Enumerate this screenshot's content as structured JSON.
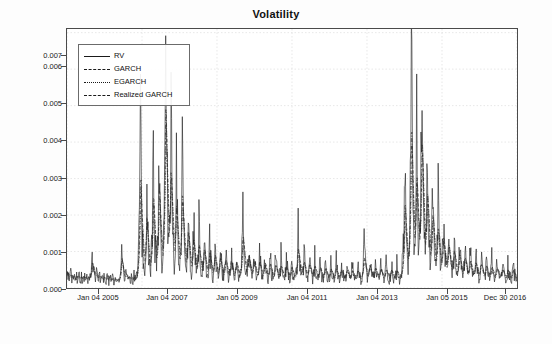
{
  "chart_data": {
    "type": "line",
    "title": "Volatility",
    "xlabel": "",
    "ylabel": "",
    "grid": true,
    "legend_position": "top-left",
    "ylim": [
      0,
      0.0071
    ],
    "ytick_labels": [
      "0.000",
      "0.001",
      "0.002",
      "0.003",
      "0.004",
      "0.005",
      "0.006",
      "0.007"
    ],
    "ytick_values": [
      0.0,
      0.001,
      0.002,
      0.003,
      0.004,
      0.005,
      0.006,
      0.007
    ],
    "xtick_labels": [
      "Jan 04 2005",
      "Jan 04 2007",
      "Jan 05 2009",
      "Jan 04 2011",
      "Jan 04 2013",
      "Jan 05 2015",
      "Dec 30 2016"
    ],
    "xtick_positions": [
      0.0,
      0.1667,
      0.3333,
      0.5,
      0.6667,
      0.8333,
      1.0
    ],
    "series": [
      {
        "name": "RV",
        "line_style": "solid",
        "color": "#1a1a1a",
        "values": [
          0.0004,
          0.00032,
          0.00028,
          0.00035,
          0.0003,
          0.00025,
          0.00027,
          0.00033,
          0.00029,
          0.00024,
          0.00031,
          0.00027,
          0.00022,
          0.00026,
          0.0003,
          0.00024,
          0.00021,
          0.00028,
          0.00034,
          0.00026,
          0.00022,
          0.00025,
          0.00031,
          0.00027,
          0.00023,
          0.0002,
          0.00026,
          0.0003,
          0.00024,
          0.00021,
          0.00027,
          0.00033,
          0.00028,
          0.00023,
          0.0002,
          0.00025,
          0.00029,
          0.00023,
          0.0002,
          0.00024,
          0.0003,
          0.00025,
          0.00021,
          0.00027,
          0.00035,
          0.00046,
          0.00062,
          0.00088,
          0.0007,
          0.00052,
          0.0004,
          0.00033,
          0.00028,
          0.00025,
          0.00031,
          0.00038,
          0.0003,
          0.00025,
          0.00022,
          0.00027,
          0.00033,
          0.00027,
          0.00023,
          0.0002,
          0.00025,
          0.0003,
          0.00025,
          0.00021,
          0.00018,
          0.00023,
          0.00028,
          0.00024,
          0.0002,
          0.00017,
          0.00022,
          0.00027,
          0.00023,
          0.00019,
          0.00016,
          0.00021,
          0.00026,
          0.00022,
          0.00019,
          0.00016,
          0.0002,
          0.00025,
          0.00021,
          0.00018,
          0.00015,
          0.00019,
          0.00024,
          0.0002,
          0.00017,
          0.00015,
          0.00019,
          0.00023,
          0.0002,
          0.00017,
          0.00021,
          0.00028,
          0.0004,
          0.00075,
          0.0011,
          0.0008,
          0.00055,
          0.0004,
          0.00032,
          0.00027,
          0.00023,
          0.00029,
          0.00036,
          0.00029,
          0.00024,
          0.0002,
          0.00026,
          0.00032,
          0.00026,
          0.00022,
          0.00018,
          0.00024,
          0.0003,
          0.00025,
          0.00021,
          0.00018,
          0.00023,
          0.00029,
          0.00024,
          0.0002,
          0.00017,
          0.00022,
          0.00028,
          0.00035,
          0.00055,
          0.00085,
          0.0012,
          0.0018,
          0.0026,
          0.0041,
          0.003,
          0.002,
          0.0014,
          0.001,
          0.00075,
          0.00058,
          0.00045,
          0.0006,
          0.00085,
          0.0013,
          0.0019,
          0.0025,
          0.0018,
          0.0012,
          0.00085,
          0.00065,
          0.0005,
          0.0004,
          0.00055,
          0.0008,
          0.00115,
          0.0016,
          0.0023,
          0.0033,
          0.0024,
          0.0017,
          0.0012,
          0.0009,
          0.0007,
          0.00055,
          0.00075,
          0.0011,
          0.00165,
          0.0025,
          0.0036,
          0.0026,
          0.0018,
          0.0013,
          0.00095,
          0.00075,
          0.0006,
          0.00085,
          0.0013,
          0.002,
          0.0031,
          0.0045,
          0.0068,
          0.0048,
          0.0034,
          0.0024,
          0.00175,
          0.0013,
          0.001,
          0.0014,
          0.002,
          0.0029,
          0.0042,
          0.003,
          0.00215,
          0.00155,
          0.00115,
          0.0009,
          0.0007,
          0.00095,
          0.0014,
          0.00205,
          0.003,
          0.00215,
          0.00155,
          0.00115,
          0.0009,
          0.0007,
          0.00055,
          0.00075,
          0.0011,
          0.0016,
          0.0024,
          0.0034,
          0.00245,
          0.00175,
          0.00125,
          0.00095,
          0.00075,
          0.0006,
          0.00048,
          0.00065,
          0.00095,
          0.0014,
          0.00205,
          0.0015,
          0.0011,
          0.00082,
          0.00062,
          0.0005,
          0.0004,
          0.00055,
          0.0008,
          0.0012,
          0.00175,
          0.0013,
          0.00095,
          0.00072,
          0.00056,
          0.00045,
          0.00037,
          0.0005,
          0.00072,
          0.00105,
          0.00155,
          0.00115,
          0.00085,
          0.00065,
          0.0005,
          0.00041,
          0.00034,
          0.00046,
          0.00066,
          0.00096,
          0.0014,
          0.00104,
          0.00077,
          0.00059,
          0.00046,
          0.00038,
          0.00032,
          0.00042,
          0.0006,
          0.00087,
          0.00127,
          0.00094,
          0.0007,
          0.00054,
          0.00043,
          0.00035,
          0.0003,
          0.00039,
          0.00055,
          0.0008,
          0.00117,
          0.00087,
          0.00065,
          0.0005,
          0.0004,
          0.00033,
          0.00028,
          0.00036,
          0.00051,
          0.00074,
          0.00108,
          0.0008,
          0.0006,
          0.00047,
          0.00038,
          0.00031,
          0.00027,
          0.00034,
          0.00048,
          0.00069,
          0.001,
          0.00075,
          0.00057,
          0.00044,
          0.00036,
          0.0003,
          0.00026,
          0.00033,
          0.00046,
          0.00066,
          0.00096,
          0.00072,
          0.00055,
          0.00043,
          0.00035,
          0.00029,
          0.00025,
          0.00032,
          0.00044,
          0.00063,
          0.00092,
          0.00069,
          0.00053,
          0.00041,
          0.00034,
          0.00028,
          0.00024,
          0.00031,
          0.00043,
          0.00061,
          0.00089,
          0.0013,
          0.0019,
          0.0014,
          0.00103,
          0.00077,
          0.00059,
          0.00047,
          0.00038,
          0.00031,
          0.0004,
          0.00056,
          0.0008,
          0.00116,
          0.00086,
          0.00064,
          0.0005,
          0.0004,
          0.00033,
          0.00028,
          0.00035,
          0.00049,
          0.0007,
          0.00101,
          0.00076,
          0.00058,
          0.00045,
          0.00036,
          0.0003,
          0.00026,
          0.00033,
          0.00045,
          0.00064,
          0.00093,
          0.0007,
          0.00054,
          0.00042,
          0.00034,
          0.00029,
          0.00025,
          0.00031,
          0.00043,
          0.00061,
          0.00088,
          0.00066,
          0.00051,
          0.0004,
          0.00033,
          0.00028,
          0.00024,
          0.0003,
          0.00041,
          0.00058,
          0.00084,
          0.00063,
          0.00049,
          0.00038,
          0.00032,
          0.00027,
          0.00023,
          0.00029,
          0.0004,
          0.00056,
          0.0008,
          0.0006,
          0.00047,
          0.00037,
          0.00031,
          0.00026,
          0.00023,
          0.00028,
          0.00038,
          0.00054,
          0.00077,
          0.00058,
          0.00045,
          0.00036,
          0.0003,
          0.00025,
          0.00022,
          0.00027,
          0.00037,
          0.00052,
          0.00074,
          0.00056,
          0.00044,
          0.00035,
          0.00029,
          0.00025,
          0.00022,
          0.00026,
          0.00036,
          0.0005,
          0.00072,
          0.00054,
          0.00042,
          0.00034,
          0.00028,
          0.00024,
          0.00021,
          0.00026,
          0.00035,
          0.00049,
          0.0007,
          0.00095,
          0.0014,
          0.00105,
          0.00079,
          0.00061,
          0.00048,
          0.00039,
          0.00032,
          0.00027,
          0.00033,
          0.00045,
          0.00063,
          0.0009,
          0.00068,
          0.00053,
          0.00042,
          0.00034,
          0.00029,
          0.00025,
          0.0003,
          0.00041,
          0.00057,
          0.00081,
          0.00061,
          0.00048,
          0.00038,
          0.00032,
          0.00027,
          0.00023,
          0.00028,
          0.00038,
          0.00053,
          0.00075,
          0.00057,
          0.00045,
          0.00036,
          0.0003,
          0.00026,
          0.00022,
          0.00027,
          0.00036,
          0.0005,
          0.00071,
          0.00054,
          0.00043,
          0.00034,
          0.00029,
          0.00025,
          0.00022,
          0.00026,
          0.00035,
          0.00048,
          0.00068,
          0.00052,
          0.00041,
          0.00033,
          0.00028,
          0.00024,
          0.00021,
          0.00025,
          0.00034,
          0.00046,
          0.00065,
          0.0005,
          0.0004,
          0.00032,
          0.00027,
          0.00023,
          0.00021,
          0.00025,
          0.00033,
          0.00045,
          0.00063,
          0.00048,
          0.00039,
          0.00031,
          0.00027,
          0.00023,
          0.0002,
          0.00024,
          0.00032,
          0.00044,
          0.00061,
          0.00047,
          0.00038,
          0.00031,
          0.00026,
          0.00023,
          0.0002,
          0.00024,
          0.00031,
          0.00043,
          0.0006,
          0.00046,
          0.00037,
          0.0003,
          0.00026,
          0.00022,
          0.0002,
          0.00023,
          0.00031,
          0.00042,
          0.00058,
          0.00045,
          0.00036,
          0.0003,
          0.00025,
          0.00022,
          0.00019,
          0.00023,
          0.0003,
          0.00041,
          0.00057,
          0.00044,
          0.00036,
          0.00029,
          0.00025,
          0.00022,
          0.00019,
          0.00023,
          0.0003,
          0.0004,
          0.00056,
          0.00075,
          0.00105,
          0.0008,
          0.00062,
          0.00049,
          0.0004,
          0.00033,
          0.00028,
          0.00024,
          0.00029,
          0.00038,
          0.00052,
          0.00072,
          0.00056,
          0.00044,
          0.00036,
          0.0003,
          0.00026,
          0.00022,
          0.00027,
          0.00035,
          0.00048,
          0.00066,
          0.00052,
          0.00042,
          0.00034,
          0.00029,
          0.00025,
          0.00021,
          0.00026,
          0.00034,
          0.00046,
          0.00063,
          0.00049,
          0.0004,
          0.00033,
          0.00028,
          0.00024,
          0.00021,
          0.00025,
          0.00033,
          0.00044,
          0.00061,
          0.00048,
          0.00039,
          0.00032,
          0.00027,
          0.00023,
          0.00021,
          0.00025,
          0.00032,
          0.00043,
          0.00059,
          0.00046,
          0.00038,
          0.00031,
          0.00026,
          0.00023,
          0.0002,
          0.00024,
          0.00031,
          0.00042,
          0.00057,
          0.00045,
          0.00037,
          0.0003,
          0.00026,
          0.00023,
          0.0002,
          0.00024,
          0.00031,
          0.00041,
          0.00056,
          0.0007,
          0.00095,
          0.0014,
          0.0021,
          0.0031,
          0.0023,
          0.00165,
          0.0012,
          0.0009,
          0.0007,
          0.00055,
          0.00075,
          0.0011,
          0.00165,
          0.0025,
          0.0038,
          0.006,
          0.0043,
          0.0031,
          0.0022,
          0.0016,
          0.0012,
          0.0009,
          0.00125,
          0.0018,
          0.0027,
          0.0041,
          0.003,
          0.00215,
          0.00155,
          0.00115,
          0.0009,
          0.00125,
          0.0018,
          0.0027,
          0.004,
          0.0051,
          0.0037,
          0.00265,
          0.0019,
          0.0014,
          0.00105,
          0.0008,
          0.0011,
          0.0016,
          0.00235,
          0.00345,
          0.0025,
          0.0018,
          0.00132,
          0.001,
          0.00078,
          0.00062,
          0.00085,
          0.00125,
          0.00182,
          0.00265,
          0.00195,
          0.00143,
          0.00107,
          0.00082,
          0.00065,
          0.00052,
          0.0007,
          0.00102,
          0.00148,
          0.00215,
          0.00158,
          0.00117,
          0.00088,
          0.00068,
          0.00055,
          0.00045,
          0.0006,
          0.00086,
          0.00124,
          0.0018,
          0.00133,
          0.00099,
          0.00075,
          0.00059,
          0.00047,
          0.00039,
          0.00052,
          0.00074,
          0.00106,
          0.00153,
          0.00113,
          0.00085,
          0.00065,
          0.00051,
          0.00042,
          0.00035,
          0.00046,
          0.00065,
          0.00092,
          0.00133,
          0.00099,
          0.00075,
          0.00058,
          0.00046,
          0.00038,
          0.00032,
          0.00042,
          0.00058,
          0.00082,
          0.00118,
          0.00088,
          0.00067,
          0.00052,
          0.00042,
          0.00035,
          0.00029,
          0.00038,
          0.00053,
          0.00074,
          0.00106,
          0.0008,
          0.00061,
          0.00048,
          0.00039,
          0.00032,
          0.00027,
          0.00035,
          0.00048,
          0.00067,
          0.00096,
          0.00073,
          0.00056,
          0.00044,
          0.00036,
          0.0003,
          0.00026,
          0.00033,
          0.00044,
          0.00062,
          0.00088,
          0.00067,
          0.00052,
          0.00041,
          0.00034,
          0.00029,
          0.00025,
          0.00031,
          0.00041,
          0.00057,
          0.00081,
          0.00062,
          0.00049,
          0.00039,
          0.00032,
          0.00027,
          0.00024,
          0.00029,
          0.00039,
          0.00054,
          0.00076,
          0.00058,
          0.00046,
          0.00037,
          0.00031,
          0.00026,
          0.00023,
          0.00028,
          0.00037,
          0.00051,
          0.00071,
          0.00055,
          0.00044,
          0.00035,
          0.0003,
          0.00025,
          0.00022,
          0.00027,
          0.00035,
          0.00048,
          0.00066,
          0.00052,
          0.00042,
          0.00034,
          0.00029,
          0.00025,
          0.00022,
          0.00026,
          0.00034,
          0.00046,
          0.00063,
          0.0005,
          0.0004,
          0.00033,
          0.00028,
          0.00024,
          0.00021,
          0.00025,
          0.00033,
          0.00045,
          0.0006,
          0.00047,
          0.00039,
          0.00032,
          0.00027,
          0.00024,
          0.00021,
          0.00025,
          0.00032,
          0.00043,
          0.00058,
          0.00046,
          0.00038,
          0.00031,
          0.00027,
          0.00023,
          0.00021,
          0.0003
        ]
      },
      {
        "name": "GARCH",
        "line_style": "dashed",
        "color": "#1a1a1a"
      },
      {
        "name": "EGARCH",
        "line_style": "dotted",
        "color": "#1a1a1a"
      },
      {
        "name": "Realized GARCH",
        "line_style": "dotdash",
        "color": "#1a1a1a"
      }
    ]
  },
  "legend": {
    "items": [
      {
        "label": "RV",
        "style": "solid"
      },
      {
        "label": "GARCH",
        "style": "dashed"
      },
      {
        "label": "EGARCH",
        "style": "dotted"
      },
      {
        "label": "Realized GARCH",
        "style": "dotdash"
      }
    ]
  }
}
